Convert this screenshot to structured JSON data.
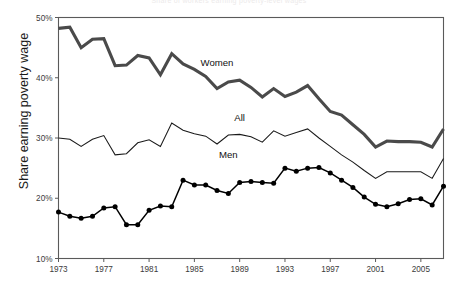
{
  "chart_data": {
    "type": "line",
    "title": "Share of workers earning poverty-level wages",
    "xlabel": "",
    "ylabel": "Share earning poverty wage",
    "ylim": [
      10,
      50
    ],
    "xlim": [
      1973,
      2007
    ],
    "ytick_labels": [
      "10%",
      "20%",
      "30%",
      "40%",
      "50%"
    ],
    "ytick_values": [
      10,
      20,
      30,
      40,
      50
    ],
    "xtick_labels": [
      "1973",
      "1977",
      "1981",
      "1985",
      "1989",
      "1993",
      "1997",
      "2001",
      "2005"
    ],
    "xtick_values": [
      1973,
      1977,
      1981,
      1985,
      1989,
      1993,
      1997,
      2001,
      2005
    ],
    "grid": false,
    "legend_position": "inline-annotations",
    "x": [
      1973,
      1974,
      1975,
      1976,
      1977,
      1978,
      1979,
      1980,
      1981,
      1982,
      1983,
      1984,
      1985,
      1986,
      1987,
      1988,
      1989,
      1990,
      1991,
      1992,
      1993,
      1994,
      1995,
      1996,
      1997,
      1998,
      1999,
      2000,
      2001,
      2002,
      2003,
      2004,
      2005,
      2006,
      2007
    ],
    "series": [
      {
        "name": "Women",
        "color": "#4a4a4a",
        "markers": false,
        "values": [
          48.2,
          48.4,
          45.0,
          46.4,
          46.5,
          42.0,
          42.1,
          43.7,
          43.3,
          40.5,
          44.0,
          42.3,
          41.4,
          40.2,
          38.2,
          39.3,
          39.6,
          38.4,
          36.8,
          38.2,
          36.9,
          37.6,
          38.7,
          36.5,
          34.4,
          33.8,
          32.2,
          30.6,
          28.5,
          29.5,
          29.4,
          29.4,
          29.3,
          28.5,
          31.5
        ]
      },
      {
        "name": "All",
        "color": "#1a1a1a",
        "markers": false,
        "values": [
          30.0,
          29.8,
          28.6,
          29.8,
          30.4,
          27.2,
          27.4,
          29.2,
          29.7,
          28.6,
          32.5,
          31.3,
          30.7,
          30.3,
          29.0,
          30.5,
          30.6,
          30.2,
          29.3,
          31.2,
          30.3,
          30.9,
          31.5,
          30.0,
          28.6,
          27.2,
          26.0,
          24.6,
          23.3,
          24.4,
          24.4,
          24.4,
          24.4,
          23.3,
          26.6
        ]
      },
      {
        "name": "Men",
        "color": "#000000",
        "markers": true,
        "values": [
          17.7,
          17.0,
          16.7,
          17.0,
          18.4,
          18.6,
          15.6,
          15.6,
          18.0,
          18.7,
          18.6,
          23.0,
          22.2,
          22.2,
          21.3,
          20.8,
          22.6,
          22.8,
          22.6,
          22.5,
          25.0,
          24.5,
          25.0,
          25.1,
          24.2,
          23.0,
          21.8,
          20.2,
          19.0,
          18.6,
          19.1,
          19.8,
          19.9,
          18.9,
          22.0
        ]
      }
    ],
    "annotations": [
      {
        "label": "Women",
        "x": 1987,
        "y": 42.0
      },
      {
        "label": "All",
        "x": 1989,
        "y": 32.9
      },
      {
        "label": "Men",
        "x": 1988,
        "y": 26.6
      }
    ]
  }
}
